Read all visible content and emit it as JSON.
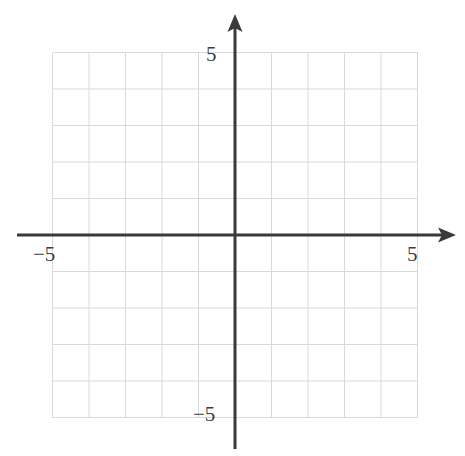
{
  "figure": {
    "title": "",
    "background_color": "#ffffff",
    "width": 465,
    "height": 456
  },
  "labels": {
    "x_negative": "−5",
    "x_positive": "5",
    "y_positive": "5",
    "y_negative": "−5"
  },
  "style": {
    "grid_color": "#d9d9dd",
    "axis_color": "#3a3a3a",
    "label_color": "#3d3d3d",
    "grid_line_width": 1,
    "axis_line_width": 3
  },
  "chart_data": {
    "type": "line",
    "title": "",
    "subtitle": "",
    "xlabel": "",
    "ylabel": "",
    "xlim": [
      -6,
      6
    ],
    "ylim": [
      -6,
      6
    ],
    "xticks": [
      -5,
      5
    ],
    "yticks": [
      -5,
      5
    ],
    "xtick_labels": [
      "−5",
      "5"
    ],
    "ytick_labels": [
      "−5",
      "5"
    ],
    "grid": true,
    "grid_minor": false,
    "grid_spacing": 1,
    "grid_x_values": [
      -5,
      -4,
      -3,
      -2,
      -1,
      0,
      1,
      2,
      3,
      4,
      5
    ],
    "grid_y_values": [
      -5,
      -4,
      -3,
      -2,
      -1,
      0,
      1,
      2,
      3,
      4,
      5
    ],
    "legend": null,
    "legend_position": "none",
    "axes_arrows": {
      "x_positive": true,
      "x_negative": false,
      "y_positive": true,
      "y_negative": false
    },
    "origin": [
      0,
      0
    ],
    "series": [],
    "annotations": []
  },
  "geometry": {
    "origin_px": {
      "x": 235,
      "y": 235
    },
    "unit_px": 36.5,
    "grid_left_px": 53,
    "grid_right_px": 418,
    "grid_top_px": 53,
    "grid_bottom_px": 418,
    "x_axis_start_px": 17,
    "x_axis_end_px": 456,
    "y_axis_top_px": 14,
    "y_axis_bottom_px": 449
  }
}
